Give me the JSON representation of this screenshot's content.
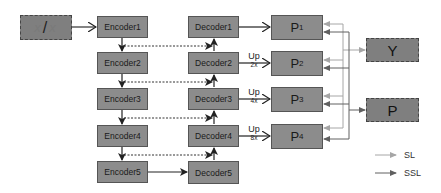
{
  "input": {
    "left": "x",
    "slash": "/",
    "right": "x"
  },
  "encoders": [
    {
      "label": "Encoder1"
    },
    {
      "label": "Encoder2"
    },
    {
      "label": "Encoder3"
    },
    {
      "label": "Encoder4"
    },
    {
      "label": "Encoder5"
    }
  ],
  "decoders": [
    {
      "label": "Decoder1"
    },
    {
      "label": "Decoder2"
    },
    {
      "label": "Decoder3"
    },
    {
      "label": "Decoder4"
    },
    {
      "label": "Decoder5"
    }
  ],
  "predictions": [
    {
      "letter": "P",
      "index": "1"
    },
    {
      "letter": "P",
      "index": "2"
    },
    {
      "letter": "P",
      "index": "3"
    },
    {
      "letter": "P",
      "index": "4"
    }
  ],
  "upsample": [
    {
      "label": "Up",
      "scale": "2x"
    },
    {
      "label": "Up",
      "scale": "4x"
    },
    {
      "label": "Up",
      "scale": "8x"
    }
  ],
  "outputs": {
    "y": "Y",
    "p": "P"
  },
  "legend": [
    {
      "label": "SL",
      "color": "#a6a6a6"
    },
    {
      "label": "SSL",
      "color": "#606060"
    }
  ],
  "colors": {
    "box_fill": "#8c8c8c",
    "box_border": "#555555",
    "sl_line": "#a6a6a6",
    "ssl_line": "#606060",
    "main_arrow": "#333333"
  }
}
